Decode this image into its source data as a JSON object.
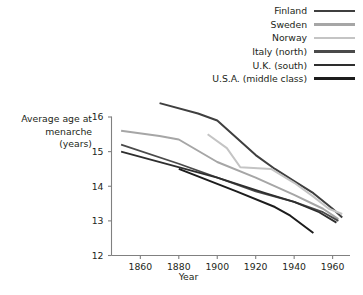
{
  "chart_data": {
    "type": "line",
    "title": "",
    "xlabel": "Year",
    "ylabel": "Average age at menarche (years)",
    "ylabel_lines": [
      "Average age at",
      "menarche",
      "(years)"
    ],
    "xlim": [
      1845,
      1968
    ],
    "ylim": [
      12,
      16
    ],
    "xticks": [
      1860,
      1880,
      1900,
      1920,
      1940,
      1960
    ],
    "xtick_labels": [
      "1860",
      "1880",
      "1900",
      "1920",
      "1940",
      "1960"
    ],
    "yticks": [
      12,
      13,
      14,
      15,
      16
    ],
    "ytick_labels": [
      "12",
      "13",
      "14",
      "15",
      "16"
    ],
    "grid": false,
    "legend_position": "top-right",
    "series": [
      {
        "name": "Finland",
        "color": "#3f3f3f",
        "width": 2.0,
        "x": [
          1870,
          1890,
          1900,
          1920,
          1930,
          1940,
          1950,
          1960,
          1965
        ],
        "y": [
          16.4,
          16.1,
          15.9,
          14.9,
          14.5,
          14.15,
          13.8,
          13.35,
          13.1
        ]
      },
      {
        "name": "Sweden",
        "color": "#a6a6a6",
        "width": 2.0,
        "x": [
          1850,
          1870,
          1880,
          1900,
          1920,
          1940,
          1955,
          1963
        ],
        "y": [
          15.6,
          15.45,
          15.35,
          14.7,
          14.25,
          13.75,
          13.35,
          13.05
        ]
      },
      {
        "name": "Norway",
        "color": "#c4c4c4",
        "width": 2.0,
        "x": [
          1895,
          1905,
          1912,
          1928,
          1940,
          1950,
          1958,
          1965
        ],
        "y": [
          15.5,
          15.1,
          14.55,
          14.5,
          14.1,
          13.7,
          13.35,
          13.2
        ]
      },
      {
        "name": "Italy (north)",
        "color": "#4a4a4a",
        "width": 1.8,
        "x": [
          1850,
          1880,
          1920,
          1940,
          1955,
          1963
        ],
        "y": [
          15.2,
          14.65,
          13.85,
          13.55,
          13.25,
          13.0
        ]
      },
      {
        "name": "U.K. (south)",
        "color": "#2e2e2e",
        "width": 1.8,
        "x": [
          1850,
          1900,
          1925,
          1940,
          1953,
          1962
        ],
        "y": [
          15.0,
          14.25,
          13.8,
          13.55,
          13.25,
          12.95
        ]
      },
      {
        "name": "U.S.A. (middle class)",
        "color": "#1c1c1c",
        "width": 2.0,
        "x": [
          1880,
          1910,
          1930,
          1938,
          1950
        ],
        "y": [
          14.5,
          13.85,
          13.4,
          13.15,
          12.65
        ]
      }
    ]
  },
  "legend": {
    "items": [
      {
        "label": "Finland",
        "color": "#3f3f3f",
        "thickness": "2.6px"
      },
      {
        "label": "Sweden",
        "color": "#a6a6a6",
        "thickness": "2.4px"
      },
      {
        "label": "Norway",
        "color": "#c4c4c4",
        "thickness": "2.4px"
      },
      {
        "label": "Italy (north)",
        "color": "#4a4a4a",
        "thickness": "2.6px"
      },
      {
        "label": "U.K. (south)",
        "color": "#2e2e2e",
        "thickness": "2.6px"
      },
      {
        "label": "U.S.A. (middle class)",
        "color": "#1c1c1c",
        "thickness": "2.8px"
      }
    ]
  },
  "axes": {
    "axis_color": "#808080"
  }
}
